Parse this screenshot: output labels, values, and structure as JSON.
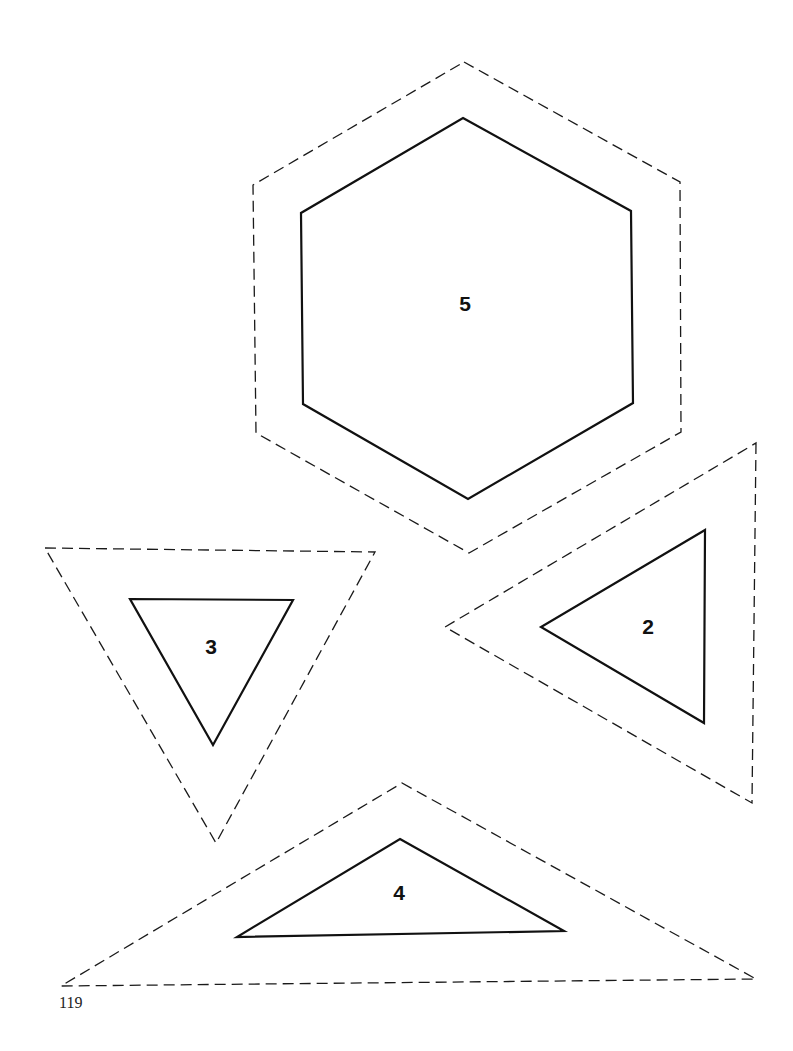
{
  "page": {
    "page_number": "119",
    "background": "#ffffff",
    "line_color": "#111111"
  },
  "templates": [
    {
      "id": "hexagon",
      "label": "5",
      "shape": "hexagon",
      "cut_line": "464,62 680,182 681,432 469,553 256,433 253,185",
      "sew_line": "463,118 631,211 633,403 468,499 303,404 301,213",
      "label_pos": [
        465,
        311
      ]
    },
    {
      "id": "triangle-2",
      "label": "2",
      "shape": "triangle",
      "cut_line": "756,443 752,803 445,627",
      "sew_line": "705,530 704,723 541,627",
      "label_pos": [
        648,
        634
      ]
    },
    {
      "id": "triangle-3",
      "label": "3",
      "shape": "triangle",
      "cut_line": "45,548 375,552 216,843",
      "sew_line": "130,599 293,600 213,745",
      "label_pos": [
        211,
        654
      ]
    },
    {
      "id": "triangle-4",
      "label": "4",
      "shape": "triangle",
      "cut_line": "402,783 756,979 61,986",
      "sew_line": "400,839 564,931 237,937",
      "label_pos": [
        399,
        900
      ]
    }
  ]
}
